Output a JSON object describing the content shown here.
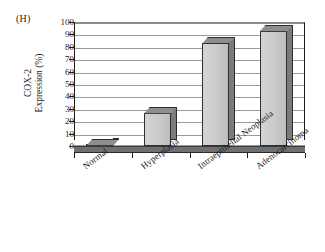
{
  "figure": {
    "panel_label": "(H)",
    "background": "#ffffff"
  },
  "axis": {
    "y_title_line1": "COX-2",
    "y_title_line2": "Expression (%)",
    "y_ticks": [
      "100",
      "90",
      "80",
      "70",
      "60",
      "50",
      "40",
      "30",
      "20",
      "10",
      "0"
    ],
    "x_labels": [
      "Normal",
      "Hyperplasia",
      "Intraepithelial Neoplasia",
      "Adenocarcinoma"
    ]
  },
  "style": {
    "bar_face_color": "#cbcbcb",
    "bar_side_color": "#7b7b7b",
    "bar_top_color": "#8e8e8e",
    "bar_edge_color": "#2e2e2e",
    "grid_color": "#9a9a9a",
    "axis_color": "#1a1a1a",
    "floor_color": "#6f6f6f"
  },
  "chart_data": {
    "type": "bar",
    "title": "",
    "subtitle": "",
    "panel": "(H)",
    "categories": [
      "Normal",
      "Hyperplasia",
      "Intraepithelial Neoplasia",
      "Adenocarcinoma"
    ],
    "values": [
      1,
      27,
      83,
      93
    ],
    "xlabel": "",
    "ylabel": "COX-2 Expression (%)",
    "ylim": [
      0,
      100
    ],
    "ytick_interval": 10,
    "yticks": [
      0,
      10,
      20,
      30,
      40,
      50,
      60,
      70,
      80,
      90,
      100
    ],
    "grid": "horizontal",
    "legend": "none",
    "three_d": true,
    "series": [
      {
        "name": "COX-2 Expression (%)",
        "values": [
          1,
          27,
          83,
          93
        ]
      }
    ]
  }
}
